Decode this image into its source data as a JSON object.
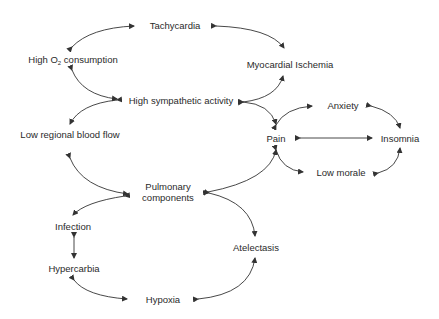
{
  "diagram": {
    "type": "cycle-diagram",
    "colors": {
      "line": "#333333",
      "text": "#2a2a2a",
      "background": "#ffffff"
    },
    "nodes": {
      "tachycardia": {
        "label": "Tachycardia"
      },
      "high_o2": {
        "label_prefix": "High O",
        "label_sub": "2",
        "label_suffix": " consumption"
      },
      "myocardial_ischemia": {
        "label": "Myocardial Ischemia"
      },
      "high_sympathetic": {
        "label": "High sympathetic activity"
      },
      "anxiety": {
        "label": "Anxiety"
      },
      "low_regional_blood_flow": {
        "label": "Low regional blood flow"
      },
      "pain": {
        "label": "Pain"
      },
      "insomnia": {
        "label": "Insomnia"
      },
      "low_morale": {
        "label": "Low morale"
      },
      "pulmonary_line1": {
        "label": "Pulmonary"
      },
      "pulmonary_line2": {
        "label": "components"
      },
      "infection": {
        "label": "Infection"
      },
      "atelectasis": {
        "label": "Atelectasis"
      },
      "hypercarbia": {
        "label": "Hypercarbia"
      },
      "hypoxia": {
        "label": "Hypoxia"
      }
    },
    "edges": [
      {
        "from": "High O2 consumption",
        "to": "Tachycardia",
        "bidirectional": true
      },
      {
        "from": "Tachycardia",
        "to": "Myocardial Ischemia",
        "bidirectional": true
      },
      {
        "from": "High O2 consumption",
        "to": "High sympathetic activity",
        "bidirectional": true
      },
      {
        "from": "High sympathetic activity",
        "to": "Myocardial Ischemia",
        "bidirectional": true
      },
      {
        "from": "High sympathetic activity",
        "to": "Low regional blood flow",
        "bidirectional": true
      },
      {
        "from": "High sympathetic activity",
        "to": "Pain",
        "bidirectional": true
      },
      {
        "from": "Pain",
        "to": "Anxiety",
        "bidirectional": true
      },
      {
        "from": "Anxiety",
        "to": "Insomnia",
        "bidirectional": true
      },
      {
        "from": "Pain",
        "to": "Insomnia",
        "bidirectional": true
      },
      {
        "from": "Pain",
        "to": "Low morale",
        "bidirectional": true
      },
      {
        "from": "Low morale",
        "to": "Insomnia",
        "bidirectional": true
      },
      {
        "from": "Low regional blood flow",
        "to": "Pulmonary components",
        "bidirectional": true
      },
      {
        "from": "Pulmonary components",
        "to": "Pain",
        "bidirectional": true
      },
      {
        "from": "Pulmonary components",
        "to": "Infection",
        "bidirectional": true
      },
      {
        "from": "Pulmonary components",
        "to": "Atelectasis",
        "bidirectional": true
      },
      {
        "from": "Infection",
        "to": "Hypercarbia",
        "bidirectional": true
      },
      {
        "from": "Hypercarbia",
        "to": "Hypoxia",
        "bidirectional": true
      },
      {
        "from": "Hypoxia",
        "to": "Atelectasis",
        "bidirectional": true
      }
    ]
  }
}
